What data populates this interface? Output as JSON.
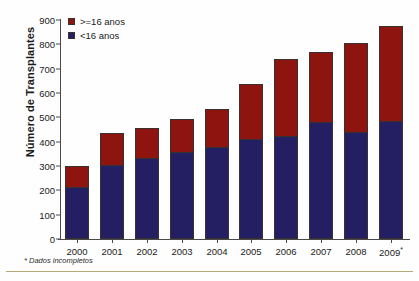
{
  "chart_data": {
    "type": "bar",
    "subtype": "stacked-vertical",
    "title": "",
    "xlabel": "",
    "ylabel": "Número de Transplantes",
    "ylim": [
      0,
      900
    ],
    "ytick_step": 100,
    "yticks": [
      900,
      800,
      700,
      600,
      500,
      400,
      300,
      200,
      100,
      0
    ],
    "grid": false,
    "legend_position": "top-left",
    "categories": [
      "2000",
      "2001",
      "2002",
      "2003",
      "2004",
      "2005",
      "2006",
      "2007",
      "2008",
      "2009"
    ],
    "category_notes": {
      "2009": "*"
    },
    "series": [
      {
        "name": "<16 anos",
        "color": "#241f62",
        "values": [
          213,
          303,
          333,
          358,
          378,
          410,
          425,
          480,
          440,
          483
        ]
      },
      {
        "name": ">=16 anos",
        "color": "#8e1410",
        "values": [
          87,
          132,
          122,
          135,
          155,
          228,
          313,
          288,
          365,
          392
        ]
      }
    ],
    "totals": [
      300,
      435,
      455,
      493,
      533,
      638,
      738,
      768,
      805,
      875
    ],
    "annotations": [
      "* Dados incompletos"
    ]
  },
  "legend": {
    "items": [
      {
        "label": ">=16 anos",
        "color": "#8e1410"
      },
      {
        "label": "<16 anos",
        "color": "#241f62"
      }
    ]
  },
  "footnote": {
    "text": "* Dados incompletos"
  },
  "colors": {
    "series_older": "#8e1410",
    "series_younger": "#241f62",
    "axis": "#4a4a4a",
    "text": "#1b1b1b",
    "rule": "#b9a878",
    "background": "#ffffff"
  }
}
